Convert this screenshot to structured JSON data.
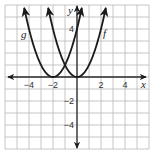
{
  "chart_data": {
    "type": "line",
    "title": "",
    "xlabel": "x",
    "ylabel": "y",
    "xlim": [
      -6,
      6
    ],
    "ylim": [
      -6,
      6
    ],
    "grid": true,
    "grid_step": 1,
    "x_ticks": [
      {
        "value": -4,
        "label": "−4"
      },
      {
        "value": -2,
        "label": "−2"
      },
      {
        "value": 2,
        "label": "2"
      },
      {
        "value": 4,
        "label": "4"
      }
    ],
    "y_ticks": [
      {
        "value": 4,
        "label": "4"
      },
      {
        "value": -2,
        "label": "−2"
      },
      {
        "value": -4,
        "label": "−4"
      }
    ],
    "series": [
      {
        "name": "f",
        "label": "f",
        "function": "x^2",
        "vertex": [
          0,
          0
        ],
        "x_range": [
          -2.4,
          2.4
        ]
      },
      {
        "name": "g",
        "label": "g",
        "function": "(x+2)^2",
        "vertex": [
          -2,
          0
        ],
        "x_range": [
          -4.4,
          0.4
        ]
      }
    ],
    "colors": {
      "curve": "#1a1a1a",
      "grid": "#b8b8b8",
      "axis": "#2a2a2a"
    }
  },
  "labels": {
    "x_axis": "x",
    "y_axis": "y",
    "f": "f",
    "g": "g"
  }
}
